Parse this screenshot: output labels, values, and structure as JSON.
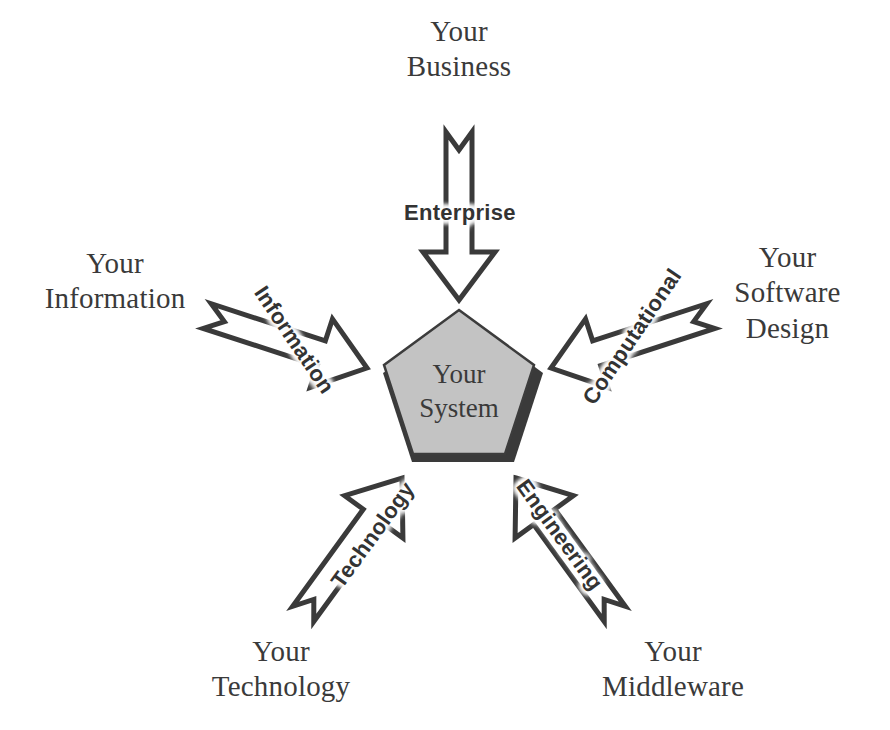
{
  "diagram": {
    "background_color": "#ffffff",
    "center": {
      "shape": "pentagon",
      "label": "Your\nSystem",
      "fill_color": "#c3c3c3",
      "stroke_color": "#3c3c3c",
      "shadow_color": "#3a3a3a"
    },
    "arrow_style": {
      "type": "hollow-block-arrow",
      "stroke_color": "#3a3a3a",
      "fill_color": "#ffffff",
      "stroke_width": 5
    },
    "viewpoints": [
      {
        "id": "enterprise",
        "label": "Enterprise",
        "outer_label": "Your\nBusiness",
        "direction": "down",
        "rotation_deg": 0
      },
      {
        "id": "information",
        "label": "Information",
        "outer_label": "Your\nInformation",
        "direction": "down-right",
        "rotation_deg": -72
      },
      {
        "id": "computational",
        "label": "Computational",
        "outer_label": "Your\nSoftware\nDesign",
        "direction": "down-left",
        "rotation_deg": 72
      },
      {
        "id": "technology",
        "label": "Technology",
        "outer_label": "Your\nTechnology",
        "direction": "up-right",
        "rotation_deg": -36
      },
      {
        "id": "engineering",
        "label": "Engineering",
        "outer_label": "Your\nMiddleware",
        "direction": "up-left",
        "rotation_deg": 36
      }
    ]
  }
}
